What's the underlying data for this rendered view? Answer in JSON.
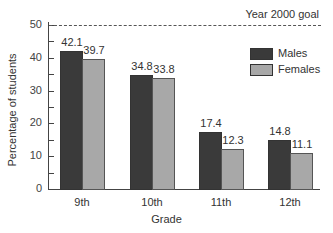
{
  "chart_data": {
    "type": "bar",
    "title": "",
    "xlabel": "Grade",
    "ylabel": "Percentage of students",
    "ylim": [
      0,
      50
    ],
    "yticks": [
      0,
      10,
      20,
      30,
      40,
      50
    ],
    "categories": [
      "9th",
      "10th",
      "11th",
      "12th"
    ],
    "series": [
      {
        "name": "Males",
        "color": "#3a3a3a",
        "values": [
          42.1,
          34.8,
          17.4,
          14.8
        ]
      },
      {
        "name": "Females",
        "color": "#a8a8a8",
        "values": [
          39.7,
          33.8,
          12.3,
          11.1
        ]
      }
    ],
    "value_labels": {
      "males": [
        "42.1",
        "34.8",
        "17.4",
        "14.8"
      ],
      "females": [
        "39.7",
        "33.8",
        "12.3",
        "11.1"
      ]
    },
    "annotations": [
      {
        "text": "Year 2000 goal",
        "y": 50,
        "style": "dashed line"
      }
    ],
    "legend": {
      "position": "upper right",
      "entries": [
        "Males",
        "Females"
      ]
    },
    "grid": false
  },
  "labels": {
    "goal": "Year 2000 goal",
    "xtitle": "Grade",
    "ytitle": "Percentage of students",
    "legend_males": "Males",
    "legend_females": "Females",
    "yticks": [
      "0",
      "10",
      "20",
      "30",
      "40",
      "50"
    ]
  }
}
